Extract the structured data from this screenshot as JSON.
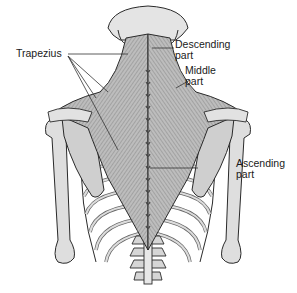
{
  "figure": {
    "labels": {
      "trapezius": "Trapezius",
      "descending": {
        "line1": "Descending",
        "line2": "part"
      },
      "middle": {
        "line1": "Middle",
        "line2": "part"
      },
      "ascending": {
        "line1": "Ascending",
        "line2": "part"
      }
    },
    "colors": {
      "background": "#ffffff",
      "bone": "#d9d9d9",
      "bone_dark": "#9a9a9a",
      "muscle": "#b5b5b5",
      "muscle_dark": "#6e6e6e",
      "outline": "#2a2a2a",
      "leader_line": "#333333"
    }
  }
}
